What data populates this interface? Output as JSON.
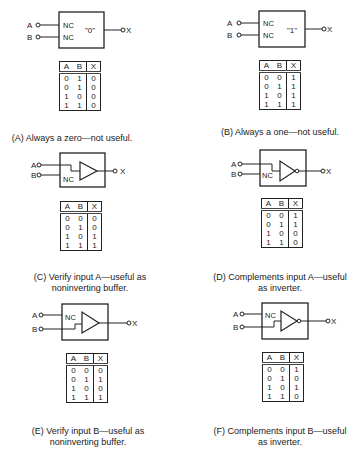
{
  "labels": {
    "a": "A",
    "b": "B",
    "x": "X",
    "nc": "NC"
  },
  "panels": [
    {
      "id": "A",
      "caption_line1": "(A) Always a zero—not useful.",
      "caption_line2": "",
      "block_text": "\"0\"",
      "kind": "constant",
      "headers": [
        "A",
        "B",
        "X"
      ],
      "rows": [
        [
          "0",
          "1",
          "0"
        ],
        [
          "0",
          "1",
          "0"
        ],
        [
          "1",
          "0",
          "0"
        ],
        [
          "1",
          "1",
          "0"
        ]
      ]
    },
    {
      "id": "B",
      "caption_line1": "(B) Always a one—not useful.",
      "caption_line2": "",
      "block_text": "\"1\"",
      "kind": "constant",
      "headers": [
        "A",
        "B",
        "X"
      ],
      "rows": [
        [
          "0",
          "0",
          "1"
        ],
        [
          "0",
          "1",
          "1"
        ],
        [
          "1",
          "0",
          "1"
        ],
        [
          "1",
          "1",
          "1"
        ]
      ]
    },
    {
      "id": "C",
      "caption_line1": "(C) Verify input A—useful as",
      "caption_line2": "noninverting buffer.",
      "kind": "buffer-A",
      "headers": [
        "A",
        "B",
        "X"
      ],
      "rows": [
        [
          "0",
          "0",
          "0"
        ],
        [
          "0",
          "1",
          "0"
        ],
        [
          "1",
          "0",
          "1"
        ],
        [
          "1",
          "1",
          "1"
        ]
      ]
    },
    {
      "id": "D",
      "caption_line1": "(D) Complements input A—useful",
      "caption_line2": "as inverter.",
      "kind": "inverter-A",
      "headers": [
        "A",
        "B",
        "X"
      ],
      "rows": [
        [
          "0",
          "0",
          "1"
        ],
        [
          "0",
          "1",
          "1"
        ],
        [
          "1",
          "0",
          "0"
        ],
        [
          "1",
          "1",
          "0"
        ]
      ]
    },
    {
      "id": "E",
      "caption_line1": "(E) Verify input B—useful as",
      "caption_line2": "noninverting buffer.",
      "kind": "buffer-B",
      "headers": [
        "A",
        "B",
        "X"
      ],
      "rows": [
        [
          "0",
          "0",
          "0"
        ],
        [
          "0",
          "1",
          "1"
        ],
        [
          "1",
          "0",
          "0"
        ],
        [
          "1",
          "1",
          "1"
        ]
      ]
    },
    {
      "id": "F",
      "caption_line1": "(F) Complements input B—useful",
      "caption_line2": "as inverter.",
      "kind": "inverter-B",
      "headers": [
        "A",
        "B",
        "X"
      ],
      "rows": [
        [
          "0",
          "0",
          "1"
        ],
        [
          "0",
          "1",
          "0"
        ],
        [
          "1",
          "0",
          "1"
        ],
        [
          "1",
          "1",
          "0"
        ]
      ]
    }
  ]
}
